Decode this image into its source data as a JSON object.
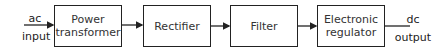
{
  "diagram": {
    "type": "block-diagram",
    "title": "",
    "input": {
      "line1": "ac",
      "line2": "input"
    },
    "output": {
      "line1": "dc",
      "line2": "output"
    },
    "blocks": [
      {
        "id": "power-transformer",
        "line1": "Power",
        "line2": "transformer"
      },
      {
        "id": "rectifier",
        "line1": "Rectifier",
        "line2": ""
      },
      {
        "id": "filter",
        "line1": "Filter",
        "line2": ""
      },
      {
        "id": "electronic-regulator",
        "line1": "Electronic",
        "line2": "regulator"
      }
    ],
    "connections": [
      {
        "from": "ac input",
        "to": "power-transformer"
      },
      {
        "from": "power-transformer",
        "to": "rectifier"
      },
      {
        "from": "rectifier",
        "to": "filter"
      },
      {
        "from": "filter",
        "to": "electronic-regulator"
      },
      {
        "from": "electronic-regulator",
        "to": "dc output"
      }
    ],
    "colors": {
      "line": "#222222",
      "background": "#ffffff",
      "text": "#333333"
    }
  }
}
